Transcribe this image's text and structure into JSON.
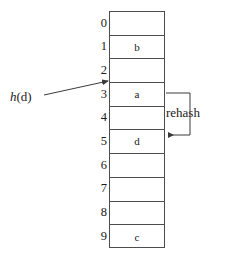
{
  "figure": {
    "table": {
      "name": "hash-table",
      "slot_count": 10,
      "rows": [
        {
          "index": "0",
          "value": ""
        },
        {
          "index": "1",
          "value": "b"
        },
        {
          "index": "2",
          "value": ""
        },
        {
          "index": "3",
          "value": "a"
        },
        {
          "index": "4",
          "value": ""
        },
        {
          "index": "5",
          "value": "d"
        },
        {
          "index": "6",
          "value": ""
        },
        {
          "index": "7",
          "value": ""
        },
        {
          "index": "8",
          "value": ""
        },
        {
          "index": "9",
          "value": "c"
        }
      ]
    },
    "annotations": {
      "hash_function": {
        "italic_part": "h",
        "rest_part": "(d)",
        "full_text": "h(d)",
        "points_to_slot": "3"
      },
      "rehash": {
        "label": "rehash",
        "from_slot": "3",
        "to_slot": "5"
      }
    },
    "colors": {
      "line": "#4d4d4d",
      "arrow": "#3a3a3a",
      "text": "#1a1a1a",
      "background": "#ffffff"
    }
  }
}
